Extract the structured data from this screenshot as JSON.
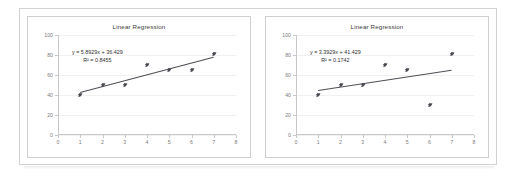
{
  "document": {
    "background_color": "#ffffff",
    "frame_color": "#d2d2d2",
    "caption": ""
  },
  "charts": [
    {
      "id": "left",
      "title": "Linear Regression",
      "equation": "y = 5.8929x + 36.429",
      "r_squared_label": "R² = 0.8455",
      "r_squared": 0.8455,
      "slope": 5.8929,
      "intercept": 36.429
    },
    {
      "id": "right",
      "title": "Linear Regression",
      "equation": "y = 3.3929x + 41.429",
      "r_squared_label": "R² = 0.1742",
      "r_squared": 0.1742,
      "slope": 3.3929,
      "intercept": 41.429
    }
  ],
  "chart_data": [
    {
      "type": "scatter",
      "title": "Linear Regression",
      "xlabel": "",
      "ylabel": "",
      "xlim": [
        0,
        8
      ],
      "ylim": [
        0,
        100
      ],
      "xticks": [
        0,
        1,
        2,
        3,
        4,
        5,
        6,
        7,
        8
      ],
      "yticks": [
        0,
        20,
        40,
        60,
        80,
        100
      ],
      "grid": true,
      "legend": "none",
      "x": [
        1,
        2,
        3,
        4,
        5,
        6,
        7
      ],
      "y": [
        40,
        50,
        50,
        70,
        65,
        65,
        81
      ],
      "series": [
        {
          "name": "data",
          "values": [
            40,
            50,
            50,
            70,
            65,
            65,
            81
          ]
        }
      ],
      "trendline": {
        "type": "linear",
        "slope": 5.8929,
        "intercept": 36.429,
        "equation": "y = 5.8929x + 36.429",
        "r_squared": 0.8455,
        "r_squared_label": "R² = 0.8455",
        "x_start": 1,
        "x_end": 7
      },
      "annotations": [
        "y = 5.8929x + 36.429",
        "R² = 0.8455"
      ]
    },
    {
      "type": "scatter",
      "title": "Linear Regression",
      "xlabel": "",
      "ylabel": "",
      "xlim": [
        0,
        8
      ],
      "ylim": [
        0,
        100
      ],
      "xticks": [
        0,
        1,
        2,
        3,
        4,
        5,
        6,
        7,
        8
      ],
      "yticks": [
        0,
        20,
        40,
        60,
        80,
        100
      ],
      "grid": true,
      "legend": "none",
      "x": [
        1,
        2,
        3,
        4,
        5,
        6,
        7
      ],
      "y": [
        40,
        50,
        50,
        70,
        65,
        30,
        81
      ],
      "series": [
        {
          "name": "data",
          "values": [
            40,
            50,
            50,
            70,
            65,
            30,
            81
          ]
        }
      ],
      "trendline": {
        "type": "linear",
        "slope": 3.3929,
        "intercept": 41.429,
        "equation": "y = 3.3929x + 41.429",
        "r_squared": 0.1742,
        "r_squared_label": "R² = 0.1742",
        "x_start": 1,
        "x_end": 7
      },
      "annotations": [
        "y = 3.3929x + 41.429",
        "R² = 0.1742"
      ]
    }
  ]
}
